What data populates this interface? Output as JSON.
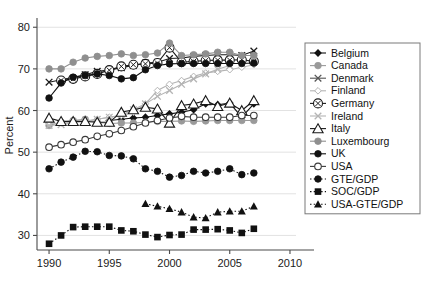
{
  "chart_data": {
    "type": "line",
    "title": "",
    "xlabel": "",
    "ylabel": "Percent",
    "xlim": [
      1989,
      2010.5
    ],
    "ylim": [
      26.5,
      81.5
    ],
    "xticks": [
      1990,
      1995,
      2000,
      2005,
      2010
    ],
    "yticks": [
      30,
      40,
      50,
      60,
      70,
      80
    ],
    "grid": true,
    "grid_axis": "y",
    "legend_position": "right",
    "series": [
      {
        "name": "Belgium",
        "marker": "filled-diamond",
        "color": "#111111",
        "x": [
          1995,
          1996,
          1997,
          1998,
          1999,
          2000,
          2001,
          2002,
          2003,
          2004,
          2005,
          2006,
          2007
        ],
        "values": [
          57.6,
          57.9,
          58.2,
          58.4,
          58.8,
          59.2,
          59.6,
          60.2,
          61.6,
          61.4,
          61.8,
          58.4,
          61.6
        ]
      },
      {
        "name": "Canada",
        "marker": "filled-circle-gray",
        "color": "#9a9a9a",
        "x": [
          1990,
          1991,
          1992,
          1993,
          1994,
          1995,
          1996,
          1997,
          1998,
          1999,
          2000,
          2001,
          2002,
          2003,
          2004,
          2005,
          2006,
          2007
        ],
        "values": [
          56.4,
          57.2,
          57.6,
          57.9,
          57.2,
          56.9,
          57.0,
          57.0,
          57.2,
          57.4,
          57.4,
          57.5,
          57.4,
          57.5,
          57.6,
          57.6,
          57.6,
          57.6
        ]
      },
      {
        "name": "Denmark",
        "marker": "cross-x",
        "color": "#1a1a1a",
        "x": [
          1990,
          1993,
          1994,
          1995,
          1996,
          1997,
          1998,
          1999,
          2000,
          2001,
          2002,
          2003,
          2004,
          2005,
          2006,
          2007
        ],
        "values": [
          66.8,
          68.6,
          69.4,
          69.7,
          70.3,
          70.8,
          71.4,
          71.6,
          72.5,
          72.6,
          73.0,
          73.2,
          73.4,
          73.4,
          73.2,
          74.3
        ]
      },
      {
        "name": "Finland",
        "marker": "open-diamond-gray",
        "color": "#b4b4b4",
        "x": [
          1990,
          1991,
          1992,
          1993,
          1994,
          1995,
          1996,
          1997,
          1998,
          1999,
          2000,
          2001,
          2002,
          2003,
          2004,
          2005,
          2006,
          2007
        ],
        "values": [
          56.9,
          57.0,
          57.2,
          57.4,
          57.9,
          58.4,
          58.8,
          59.6,
          61.6,
          64.8,
          66.3,
          67.2,
          68.2,
          69.0,
          69.4,
          69.8,
          70.4,
          71.0
        ]
      },
      {
        "name": "Germany",
        "marker": "open-circle-cross",
        "color": "#1a1a1a",
        "x": [
          1991,
          1992,
          1993,
          1994,
          1995,
          1996,
          1997,
          1998,
          1999,
          2000,
          2001,
          2002,
          2003,
          2004,
          2005,
          2006,
          2007
        ],
        "values": [
          67.2,
          67.6,
          68.2,
          68.8,
          69.7,
          70.6,
          71.0,
          71.2,
          71.4,
          75.1,
          71.6,
          71.8,
          72.0,
          72.1,
          72.1,
          72.2,
          71.8
        ]
      },
      {
        "name": "Ireland",
        "marker": "cross-x-gray",
        "color": "#b4b4b4",
        "x": [
          1990,
          1991,
          1992,
          1993,
          1994,
          1995,
          1996,
          1997,
          1998,
          1999,
          2000,
          2001,
          2002,
          2003,
          2004,
          2005
        ],
        "values": [
          56.4,
          56.6,
          57.2,
          57.4,
          57.9,
          58.4,
          58.9,
          60.2,
          61.6,
          63.4,
          64.8,
          66.3,
          67.6,
          68.8,
          69.9,
          70.8
        ]
      },
      {
        "name": "Italy",
        "marker": "open-triangle",
        "color": "#1a1a1a",
        "x": [
          1990,
          1991,
          1992,
          1993,
          1994,
          1995,
          1996,
          1997,
          1998,
          1999,
          2000,
          2001,
          2002,
          2003,
          2004,
          2005,
          2006,
          2007
        ],
        "values": [
          58.2,
          57.4,
          57.4,
          57.4,
          57.2,
          57.2,
          59.6,
          60.2,
          60.8,
          60.4,
          57.0,
          61.2,
          61.6,
          62.4,
          61.0,
          61.8,
          60.0,
          62.4
        ]
      },
      {
        "name": "Luxembourg",
        "marker": "filled-circle-gray",
        "color": "#8f8f8f",
        "x": [
          1990,
          1991,
          1992,
          1993,
          1994,
          1995,
          1996,
          1997,
          1998,
          1999,
          2000,
          2001,
          2002,
          2003,
          2004,
          2005,
          2006,
          2007
        ],
        "values": [
          70.0,
          70.0,
          71.6,
          72.6,
          73.0,
          73.2,
          73.6,
          73.2,
          73.4,
          73.8,
          76.2,
          73.2,
          73.4,
          73.6,
          74.0,
          74.0,
          73.2,
          73.2
        ]
      },
      {
        "name": "UK",
        "marker": "filled-circle",
        "color": "#111111",
        "x": [
          1990,
          1991,
          1992,
          1993,
          1994,
          1995,
          1996,
          1997,
          1998,
          1999,
          2000,
          2001,
          2002,
          2003,
          2004,
          2005,
          2006,
          2007
        ],
        "values": [
          63.0,
          66.6,
          68.0,
          68.4,
          68.8,
          68.4,
          67.6,
          67.9,
          69.8,
          70.8,
          71.2,
          71.3,
          71.3,
          71.3,
          71.3,
          71.3,
          71.3,
          71.4
        ]
      },
      {
        "name": "USA",
        "marker": "open-circle",
        "color": "#3a3a3a",
        "x": [
          1990,
          1991,
          1992,
          1993,
          1994,
          1995,
          1996,
          1997,
          1998,
          1999,
          2000,
          2001,
          2002,
          2003,
          2004,
          2005,
          2006,
          2007
        ],
        "values": [
          51.2,
          51.8,
          52.4,
          53.0,
          53.8,
          54.4,
          55.2,
          56.1,
          57.0,
          57.6,
          58.2,
          58.6,
          58.4,
          58.4,
          58.4,
          58.4,
          58.8,
          58.8
        ]
      },
      {
        "name": "GTE/GDP",
        "marker": "filled-circle",
        "color": "#111111",
        "x": [
          1990,
          1991,
          1992,
          1993,
          1994,
          1995,
          1996,
          1997,
          1998,
          1999,
          2000,
          2001,
          2002,
          2003,
          2004,
          2005,
          2006,
          2007
        ],
        "values": [
          46.0,
          47.6,
          48.8,
          50.2,
          50.1,
          49.2,
          49.1,
          48.4,
          46.0,
          45.4,
          44.0,
          44.4,
          45.4,
          45.0,
          45.4,
          46.0,
          44.6,
          45.0
        ]
      },
      {
        "name": "SOC/GDP",
        "marker": "filled-square",
        "color": "#111111",
        "x": [
          1990,
          1991,
          1992,
          1993,
          1994,
          1995,
          1996,
          1997,
          1998,
          1999,
          2000,
          2001,
          2002,
          2003,
          2004,
          2005,
          2006,
          2007
        ],
        "values": [
          28.0,
          30.0,
          32.0,
          32.1,
          32.1,
          32.1,
          31.2,
          31.0,
          30.2,
          29.6,
          30.1,
          30.2,
          31.4,
          31.4,
          31.5,
          31.2,
          30.6,
          31.6
        ]
      },
      {
        "name": "USA-GTE/GDP",
        "marker": "filled-triangle",
        "color": "#111111",
        "x": [
          1998,
          1999,
          2000,
          2001,
          2002,
          2003,
          2004,
          2005,
          2006,
          2007
        ],
        "values": [
          37.6,
          37.0,
          36.4,
          35.6,
          34.4,
          34.2,
          35.6,
          35.8,
          35.8,
          37.0
        ]
      }
    ]
  },
  "legend": {
    "items": [
      {
        "label": "Belgium",
        "marker": "filled-diamond",
        "color": "#111111"
      },
      {
        "label": "Canada",
        "marker": "filled-circle-gray",
        "color": "#9a9a9a"
      },
      {
        "label": "Denmark",
        "marker": "cross-x",
        "color": "#555555"
      },
      {
        "label": "Finland",
        "marker": "open-diamond-gray",
        "color": "#b4b4b4"
      },
      {
        "label": "Germany",
        "marker": "open-circle-cross",
        "color": "#1a1a1a"
      },
      {
        "label": "Ireland",
        "marker": "cross-x-gray",
        "color": "#b4b4b4"
      },
      {
        "label": "Italy",
        "marker": "open-triangle",
        "color": "#1a1a1a"
      },
      {
        "label": "Luxembourg",
        "marker": "filled-circle-gray",
        "color": "#8f8f8f"
      },
      {
        "label": "UK",
        "marker": "filled-circle",
        "color": "#111111"
      },
      {
        "label": "USA",
        "marker": "open-circle",
        "color": "#3a3a3a"
      },
      {
        "label": "GTE/GDP",
        "marker": "filled-circle",
        "color": "#111111"
      },
      {
        "label": "SOC/GDP",
        "marker": "filled-square",
        "color": "#111111"
      },
      {
        "label": "USA-GTE/GDP",
        "marker": "filled-triangle",
        "color": "#111111"
      }
    ]
  },
  "style": {
    "background": "#ffffff",
    "axis_color": "#4a4a4a",
    "grid_color": "#e2e2e2",
    "text_color": "#1a1a1a",
    "legend_border": "#7a7a7a"
  }
}
